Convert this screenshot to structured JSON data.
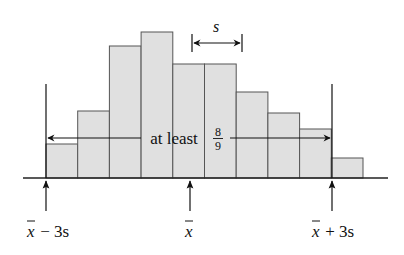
{
  "chart_data": {
    "type": "bar",
    "title": "",
    "subtitle": "Chebyshev's rule: at least 8/9 of observations lie within 3 standard deviations of the mean",
    "xlabel": "",
    "ylabel": "",
    "grid": false,
    "categories": [
      "1",
      "2",
      "3",
      "4",
      "5",
      "6",
      "7",
      "8",
      "9",
      "10"
    ],
    "values": [
      34,
      67,
      132,
      146,
      114,
      114,
      86,
      65,
      49,
      20
    ],
    "bar_fill": "#e0e0e0",
    "bar_stroke": "#555555",
    "annotations": {
      "width_marker": "s",
      "range_label_prefix": "at least",
      "fraction_num": "8",
      "fraction_den": "9",
      "ticks": [
        {
          "label_base": "x",
          "label_suffix": " − 3s",
          "position": "mean minus 3 sd"
        },
        {
          "label_base": "x",
          "label_suffix": "",
          "position": "mean"
        },
        {
          "label_base": "x",
          "label_suffix": " + 3s",
          "position": "mean plus 3 sd"
        }
      ]
    }
  }
}
